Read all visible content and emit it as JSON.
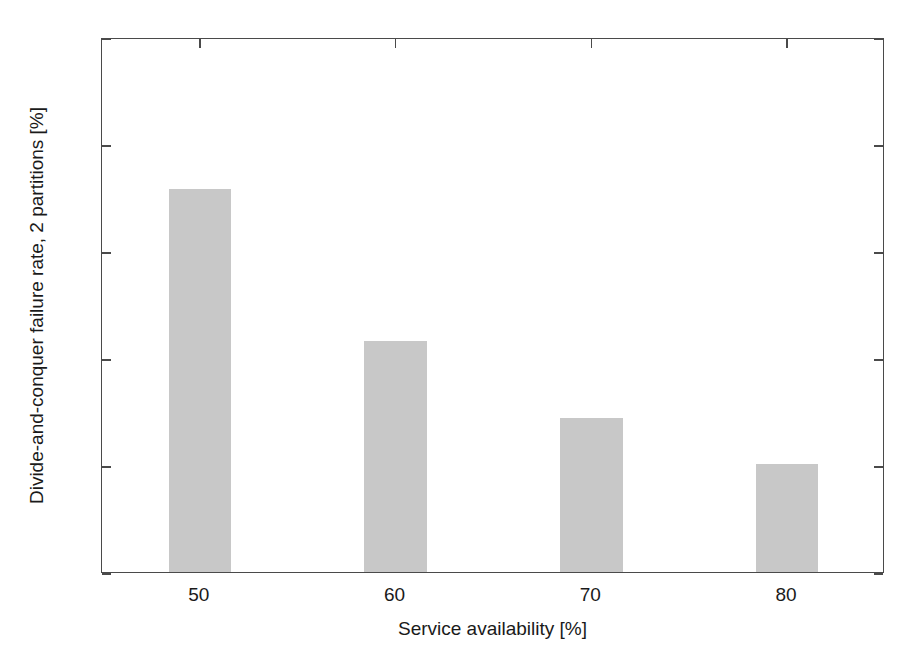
{
  "figure": {
    "top_fragment": "",
    "background_color": "#ffffff",
    "frame_color": "#4a4a4a"
  },
  "chart_data": {
    "type": "bar",
    "title": "",
    "categories": [
      "50",
      "60",
      "70",
      "80"
    ],
    "values": [
      35.8,
      21.6,
      14.4,
      10.1
    ],
    "series": [
      {
        "name": "Divide-and-conquer failure rate, 2 partitions",
        "values": [
          35.8,
          21.6,
          14.4,
          10.1
        ]
      }
    ],
    "xlabel": "Service availability [%]",
    "ylabel": "Divide-and-conquer failure rate, 2 partitions [%]",
    "xlim": [
      45,
      85
    ],
    "ylim": [
      0,
      50
    ],
    "yticks": [
      "0",
      "10",
      "20",
      "30",
      "40",
      "50"
    ],
    "ytick_values": [
      0,
      10,
      20,
      30,
      40,
      50
    ],
    "xticks": [
      "50",
      "60",
      "70",
      "80"
    ],
    "xtick_values": [
      50,
      60,
      70,
      80
    ],
    "grid": false,
    "legend": null,
    "bar_color": "#c8c8c8",
    "bar_width_units": 3.2
  }
}
